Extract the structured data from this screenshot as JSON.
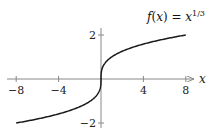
{
  "chart_data": {
    "type": "line",
    "title_parts": {
      "f": "f",
      "lp": "(",
      "x": "x",
      "rp": ")",
      "eq": " = ",
      "base": "x",
      "exp": "1/3"
    },
    "xlabel": "x",
    "ylabel": "",
    "xlim": [
      -8.5,
      8.5
    ],
    "ylim": [
      -2.1,
      2.1
    ],
    "x_ticks": [
      -8,
      -4,
      4,
      8
    ],
    "x_tick_labels": [
      "−8",
      "−4",
      "4",
      "8"
    ],
    "y_ticks": [
      -2,
      2
    ],
    "y_tick_labels": [
      "−2",
      "2"
    ],
    "grid": false,
    "legend": null,
    "series": [
      {
        "name": "f(x) = x^(1/3)",
        "color": "#1a1a1a",
        "x": [
          -8,
          -6,
          -4,
          -2,
          -1,
          -0.5,
          -0.125,
          -0.01,
          0,
          0.01,
          0.125,
          0.5,
          1,
          2,
          4,
          6,
          8
        ],
        "y": [
          -2,
          -1.817,
          -1.587,
          -1.26,
          -1,
          -0.794,
          -0.5,
          -0.215,
          0,
          0.215,
          0.5,
          0.794,
          1,
          1.26,
          1.587,
          1.817,
          2
        ]
      }
    ]
  },
  "colors": {
    "axis": "#888888",
    "curve": "#1a1a1a",
    "text": "#222222"
  }
}
